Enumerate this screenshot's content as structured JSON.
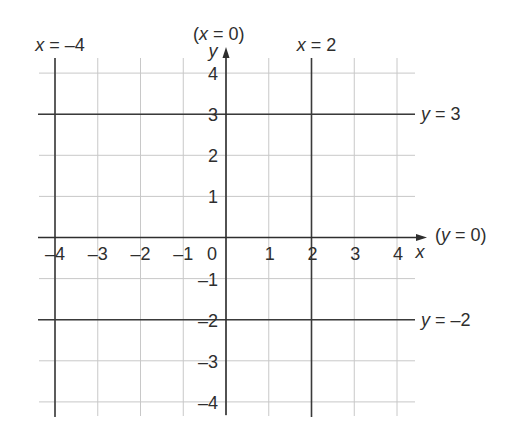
{
  "chart_data": {
    "type": "line",
    "title": "",
    "xlabel": "x",
    "ylabel": "y",
    "xlim": [
      -4,
      4
    ],
    "ylim": [
      -4,
      4
    ],
    "grid": true,
    "x_ticks": [
      -4,
      -3,
      -2,
      -1,
      0,
      1,
      2,
      3,
      4
    ],
    "x_tick_labels": [
      "–4",
      "–3",
      "–2",
      "–1",
      "0",
      "1",
      "2",
      "3",
      "4"
    ],
    "y_ticks": [
      4,
      3,
      2,
      1,
      -1,
      -2,
      -3,
      -4
    ],
    "y_tick_labels": [
      "4",
      "3",
      "2",
      "1",
      "–1",
      "–2",
      "–3",
      "–4"
    ],
    "axis_annotations": {
      "y_axis": {
        "text": "(x = 0)",
        "prefix": "(",
        "variable": "x",
        "suffix": " = 0)",
        "position": "top"
      },
      "x_axis": {
        "text": "(y = 0)",
        "prefix": "(",
        "variable": "y",
        "suffix": " = 0)",
        "position": "right"
      }
    },
    "series": [
      {
        "name": "x = –4",
        "type": "vertical_line",
        "x": -4,
        "label": {
          "variable": "x",
          "equation": " = –4",
          "position": "top"
        }
      },
      {
        "name": "x = 2",
        "type": "vertical_line",
        "x": 2,
        "label": {
          "variable": "x",
          "equation": " = 2",
          "position": "top"
        }
      },
      {
        "name": "y = 3",
        "type": "horizontal_line",
        "y": 3,
        "label": {
          "variable": "y",
          "equation": " = 3",
          "position": "right"
        }
      },
      {
        "name": "y = –2",
        "type": "horizontal_line",
        "y": -2,
        "label": {
          "variable": "y",
          "equation": " = –2",
          "position": "right"
        }
      }
    ]
  }
}
